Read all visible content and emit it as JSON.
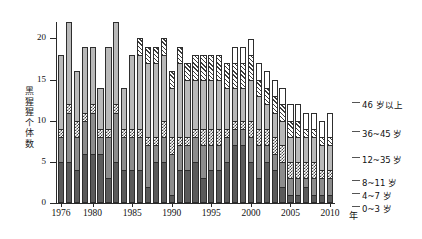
{
  "chart_data": {
    "type": "bar",
    "subtype": "stacked-bar",
    "title": "",
    "xlabel": "年",
    "ylabel": "黑猩猩个体数",
    "ylim": [
      0,
      22
    ],
    "yticks": [
      0,
      5,
      10,
      15,
      20
    ],
    "grid": false,
    "legend_position": "right",
    "categories": [
      "1976",
      "1977",
      "1978",
      "1979",
      "1980",
      "1981",
      "1982",
      "1983",
      "1984",
      "1985",
      "1986",
      "1987",
      "1988",
      "1989",
      "1990",
      "1991",
      "1992",
      "1993",
      "1994",
      "1995",
      "1996",
      "1997",
      "1998",
      "1999",
      "2000",
      "2001",
      "2002",
      "2003",
      "2004",
      "2005",
      "2006",
      "2007",
      "2008",
      "2009",
      "2010"
    ],
    "xtick_labels": [
      "1976",
      "1980",
      "1985",
      "1990",
      "1995",
      "2000",
      "2005",
      "2010"
    ],
    "xtick_categories": [
      "1976",
      "1980",
      "1985",
      "1990",
      "1995",
      "2000",
      "2005",
      "2010"
    ],
    "series": [
      {
        "name": "0~3 岁",
        "pattern": "solid-dark-grey",
        "color": "#5a5a5a",
        "values": [
          5,
          5,
          4,
          6,
          6,
          6,
          3,
          5,
          4,
          4,
          4,
          2,
          5,
          5,
          1,
          4,
          4,
          5,
          3,
          4,
          4,
          5,
          7,
          7,
          5,
          3,
          5,
          4,
          2,
          1,
          1,
          2,
          1,
          1,
          1
        ]
      },
      {
        "name": "4~7 岁",
        "pattern": "solid-mid-grey",
        "color": "#8c8c8c",
        "values": [
          3,
          6,
          4,
          4,
          5,
          2,
          5,
          6,
          4,
          4,
          4,
          5,
          2,
          3,
          5,
          3,
          3,
          3,
          4,
          3,
          3,
          3,
          2,
          2,
          3,
          4,
          2,
          2,
          3,
          2,
          2,
          1,
          2,
          2,
          2
        ]
      },
      {
        "name": "8~11 岁",
        "pattern": "checker",
        "color": "#4a4a4a",
        "values": [
          1,
          1,
          2,
          1,
          1,
          1,
          1,
          1,
          1,
          1,
          1,
          1,
          1,
          2,
          2,
          1,
          1,
          1,
          2,
          2,
          2,
          1,
          1,
          1,
          2,
          2,
          2,
          2,
          2,
          2,
          2,
          2,
          2,
          1,
          1
        ]
      },
      {
        "name": "12~35 岁",
        "pattern": "solid-light-grey",
        "color": "#b9b9b9",
        "values": [
          9,
          10,
          6,
          8,
          7,
          5,
          10,
          10,
          5,
          9,
          9,
          9,
          9,
          8,
          6,
          9,
          7,
          6,
          6,
          6,
          6,
          5,
          4,
          4,
          5,
          4,
          3,
          3,
          3,
          3,
          3,
          3,
          3,
          3,
          3
        ]
      },
      {
        "name": "36~45 岁",
        "pattern": "diagonal-hatch",
        "color": "#3d3d3d",
        "values": [
          0,
          0,
          0,
          0,
          0,
          0,
          0,
          0,
          0,
          0,
          2,
          2,
          2,
          2,
          2,
          2,
          2,
          3,
          3,
          3,
          3,
          3,
          3,
          3,
          3,
          2,
          2,
          2,
          2,
          2,
          2,
          1,
          1,
          1,
          1
        ]
      },
      {
        "name": "46 岁以上",
        "pattern": "white",
        "color": "#ffffff",
        "values": [
          0,
          0,
          0,
          0,
          0,
          0,
          0,
          0,
          0,
          0,
          0,
          0,
          0,
          0,
          0,
          0,
          0,
          0,
          0,
          0,
          0,
          0,
          2,
          2,
          2,
          2,
          2,
          2,
          2,
          2,
          2,
          2,
          2,
          2,
          3
        ]
      }
    ]
  },
  "axes": {
    "y_label_chars": [
      "黑",
      "猩",
      "猩",
      "个",
      "体",
      "数"
    ],
    "x_unit": "年"
  },
  "legend": {
    "items": [
      {
        "label": "46 岁以上",
        "key": "46plus"
      },
      {
        "label": "36~45 岁",
        "key": "36-45"
      },
      {
        "label": "12~35 岁",
        "key": "12-35"
      },
      {
        "label": "8~11 岁",
        "key": "8-11"
      },
      {
        "label": "4~7 岁",
        "key": "4-7"
      },
      {
        "label": "0~3 岁",
        "key": "0-3"
      }
    ]
  }
}
